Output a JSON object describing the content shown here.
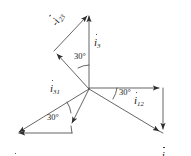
{
  "diagram": {
    "type": "phasor-vector-diagram",
    "origin": {
      "x": 89,
      "y": 89
    },
    "stroke_color": "#3c3c3c",
    "text_color": "#1a1a1a",
    "background": "#ffffff",
    "angle_labels": [
      {
        "name": "angle-top",
        "text": "30°"
      },
      {
        "name": "angle-right",
        "text": "30°"
      },
      {
        "name": "angle-bottom-left",
        "text": "30°"
      }
    ],
    "vectors": [
      {
        "name": "i3",
        "base": "i",
        "subscript": "3",
        "sign": "",
        "label": "i3",
        "angle_deg": 90,
        "tip": {
          "x": 89,
          "y": 12
        }
      },
      {
        "name": "i2",
        "base": "i",
        "subscript": "2",
        "sign": "",
        "label": "i2",
        "angle_deg": 210,
        "tip": {
          "x": 15,
          "y": 133
        }
      },
      {
        "name": "i1",
        "base": "i",
        "subscript": "1",
        "sign": "",
        "label": "i1",
        "angle_deg": 330,
        "tip": {
          "x": 163,
          "y": 133
        }
      },
      {
        "name": "i12",
        "base": "i",
        "subscript": "12",
        "sign": "",
        "label": "i12",
        "angle_deg": 0,
        "tip": {
          "x": 163,
          "y": 88
        }
      },
      {
        "name": "i31",
        "base": "i",
        "subscript": "31",
        "sign": "",
        "label": "i31",
        "angle_deg": 120,
        "tip": {
          "x": 54,
          "y": 50
        }
      },
      {
        "name": "i23",
        "base": "i",
        "subscript": "23",
        "sign": "",
        "label": "i23",
        "angle_deg": 240,
        "tip": {
          "x": 70,
          "y": 127
        }
      },
      {
        "name": "neg-i31",
        "base": "i",
        "subscript": "31",
        "sign": "-",
        "label": "-i31",
        "from": {
          "x": 163,
          "y": 88
        },
        "tip": {
          "x": 163,
          "y": 133
        }
      },
      {
        "name": "neg-i12",
        "base": "i",
        "subscript": "12",
        "sign": "-",
        "label": "-i12",
        "from": {
          "x": 70,
          "y": 133
        },
        "tip": {
          "x": 15,
          "y": 133
        }
      },
      {
        "name": "neg-i23",
        "base": "i",
        "subscript": "23",
        "sign": "-",
        "label": "-i23",
        "from": {
          "x": 54,
          "y": 50
        },
        "tip": {
          "x": 89,
          "y": 12
        }
      }
    ],
    "labels": {
      "neg_i23": {
        "sign": "-",
        "base": "i",
        "sub": "23"
      },
      "i3": {
        "sign": "",
        "base": "i",
        "sub": "3"
      },
      "i31": {
        "sign": "",
        "base": "i",
        "sub": "31"
      },
      "i12": {
        "sign": "",
        "base": "i",
        "sub": "12"
      },
      "neg_i31": {
        "sign": "-",
        "base": "i",
        "sub": "31"
      },
      "i2": {
        "sign": "",
        "base": "i",
        "sub": "2"
      },
      "i23": {
        "sign": "",
        "base": "i",
        "sub": "23"
      },
      "neg_i12": {
        "sign": "-",
        "base": "i",
        "sub": "12"
      },
      "i1": {
        "sign": "",
        "base": "i",
        "sub": "1"
      }
    }
  }
}
